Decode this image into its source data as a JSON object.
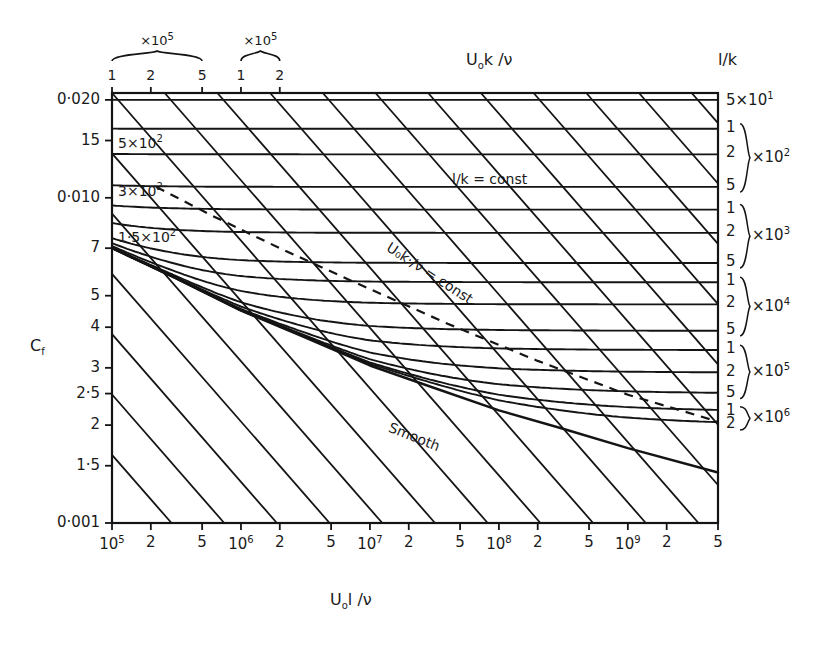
{
  "figure": {
    "kind": "engineering-chart",
    "background": "#ffffff",
    "ink_color": "#141414"
  },
  "axes": {
    "x": {
      "title_parts": {
        "main": "U",
        "sub": "o",
        "rest": "l /ν"
      },
      "title": "U₀ l /ν",
      "scale": "log",
      "range": [
        100000,
        5000000000
      ],
      "ticks": [
        {
          "value": 100000.0,
          "label": "10",
          "exp": "5"
        },
        {
          "value": 200000.0,
          "label": "2",
          "exp": ""
        },
        {
          "value": 500000.0,
          "label": "5",
          "exp": ""
        },
        {
          "value": 1000000.0,
          "label": "10",
          "exp": "6"
        },
        {
          "value": 2000000.0,
          "label": "2",
          "exp": ""
        },
        {
          "value": 5000000.0,
          "label": "5",
          "exp": ""
        },
        {
          "value": 10000000.0,
          "label": "10",
          "exp": "7"
        },
        {
          "value": 20000000.0,
          "label": "2",
          "exp": ""
        },
        {
          "value": 50000000.0,
          "label": "5",
          "exp": ""
        },
        {
          "value": 100000000.0,
          "label": "10",
          "exp": "8"
        },
        {
          "value": 200000000.0,
          "label": "2",
          "exp": ""
        },
        {
          "value": 500000000.0,
          "label": "5",
          "exp": ""
        },
        {
          "value": 1000000000.0,
          "label": "10",
          "exp": "9"
        },
        {
          "value": 2000000000.0,
          "label": "2",
          "exp": ""
        },
        {
          "value": 5000000000.0,
          "label": "5",
          "exp": ""
        }
      ]
    },
    "y": {
      "title_parts": {
        "main": "C",
        "sub": "f"
      },
      "title": "Cf",
      "scale": "log",
      "range": [
        0.001,
        0.021
      ],
      "ticks": [
        {
          "value": 0.02,
          "label": "0·020"
        },
        {
          "value": 0.015,
          "label": "15"
        },
        {
          "value": 0.01,
          "label": "0·010"
        },
        {
          "value": 0.007,
          "label": "7"
        },
        {
          "value": 0.005,
          "label": "5"
        },
        {
          "value": 0.004,
          "label": "4"
        },
        {
          "value": 0.003,
          "label": "3"
        },
        {
          "value": 0.0025,
          "label": "2·5"
        },
        {
          "value": 0.002,
          "label": "2"
        },
        {
          "value": 0.0015,
          "label": "1·5"
        },
        {
          "value": 0.001,
          "label": "0·001"
        }
      ]
    },
    "top": {
      "title_parts": {
        "main": "U",
        "sub": "o",
        "rest": "k /ν"
      },
      "title": "U₀k /ν",
      "groups": [
        {
          "multiplier": "×10",
          "exp": "3",
          "ticks": [
            "1",
            "2",
            "3",
            "5"
          ],
          "tick_values": [
            1000,
            2000,
            3000,
            5000
          ]
        },
        {
          "multiplier": "×10",
          "exp": "5",
          "ticks": [
            "1",
            "2",
            "5"
          ],
          "tick_values": [
            100000,
            200000,
            500000
          ]
        },
        {
          "multiplier": "×10",
          "exp": "5",
          "ticks": [
            "1",
            "2"
          ],
          "tick_values": [
            1000000,
            2000000
          ]
        }
      ]
    },
    "right": {
      "title": "l/k",
      "top_label": {
        "mantissa": "5",
        "multiplier": "×10",
        "exp": "1"
      },
      "groups": [
        {
          "ticks": [
            "1",
            "2",
            "5"
          ],
          "multiplier": "×10",
          "exp": "2",
          "values": [
            100,
            200,
            500
          ]
        },
        {
          "ticks": [
            "1",
            "2",
            "5"
          ],
          "multiplier": "×10",
          "exp": "3",
          "values": [
            1000,
            2000,
            5000
          ]
        },
        {
          "ticks": [
            "1",
            "2",
            "5"
          ],
          "multiplier": "×10",
          "exp": "4",
          "values": [
            10000,
            20000,
            50000
          ]
        },
        {
          "ticks": [
            "1",
            "2",
            "5"
          ],
          "multiplier": "×10",
          "exp": "5",
          "values": [
            100000,
            200000,
            500000
          ]
        },
        {
          "ticks": [
            "1",
            "2"
          ],
          "multiplier": "×10",
          "exp": "6",
          "values": [
            1000000,
            2000000
          ]
        }
      ]
    }
  },
  "annotations": {
    "lk_const": "l/k  = const",
    "uk_const": "U₀k·/ν = const",
    "smooth": "Smooth"
  },
  "curve_labels_left": [
    {
      "mantissa": "5×10",
      "exp": "2",
      "text": "5×10²"
    },
    {
      "mantissa": "3×10",
      "exp": "2",
      "text": "3×10²"
    },
    {
      "mantissa": "1·5×10",
      "exp": "2",
      "text": "1·5×10²"
    }
  ],
  "chart_data": {
    "type": "line",
    "xlabel": "U₀ l /ν",
    "ylabel": "Cf",
    "xscale": "log",
    "yscale": "log",
    "xlim": [
      100000,
      5000000000
    ],
    "ylim": [
      0.001,
      0.021
    ],
    "grid": false,
    "legend": "inline-annotations",
    "series_families": [
      {
        "name": "l/k = const (relative roughness curves)",
        "style": "solid",
        "note": "Each curve falls with Re then flattens to a constant C_f plateau at the right edge; plateau value set by l/k.",
        "curves": [
          {
            "lk": 50,
            "label": "5×10¹",
            "plateau_cf": 0.02
          },
          {
            "lk": 100,
            "label": "1×10²",
            "plateau_cf": 0.0163
          },
          {
            "lk": 200,
            "label": "2×10²",
            "plateau_cf": 0.0136
          },
          {
            "lk": 500,
            "label": "5×10²",
            "plateau_cf": 0.0108
          },
          {
            "lk": 1000,
            "label": "1×10³",
            "plateau_cf": 0.0092
          },
          {
            "lk": 2000,
            "label": "2×10³",
            "plateau_cf": 0.0078
          },
          {
            "lk": 5000,
            "label": "5×10³",
            "plateau_cf": 0.0063
          },
          {
            "lk": 10000,
            "label": "1×10⁴",
            "plateau_cf": 0.0055
          },
          {
            "lk": 20000,
            "label": "2×10⁴",
            "plateau_cf": 0.0047
          },
          {
            "lk": 50000,
            "label": "5×10⁴",
            "plateau_cf": 0.0039
          },
          {
            "lk": 100000,
            "label": "1×10⁵",
            "plateau_cf": 0.0034
          },
          {
            "lk": 200000,
            "label": "2×10⁵",
            "plateau_cf": 0.0029
          },
          {
            "lk": 500000,
            "label": "5×10⁵",
            "plateau_cf": 0.0025
          },
          {
            "lk": 1000000,
            "label": "1×10⁶",
            "plateau_cf": 0.0022
          },
          {
            "lk": 2000000,
            "label": "2×10⁶",
            "plateau_cf": 0.002
          }
        ]
      },
      {
        "name": "U₀k/ν = const (roughness Reynolds number lines)",
        "style": "solid-diagonal",
        "note": "Straight descending lines crossing the field from the top edge to the lower right.",
        "curves": [
          {
            "uk": 1000,
            "label": "1×10³"
          },
          {
            "uk": 2000,
            "label": "2×10³"
          },
          {
            "uk": 3000,
            "label": "3×10³"
          },
          {
            "uk": 5000,
            "label": "5×10³"
          },
          {
            "uk": 100000,
            "label": "1×10⁵"
          },
          {
            "uk": 200000,
            "label": "2×10⁵"
          },
          {
            "uk": 500000,
            "label": "5×10⁵"
          },
          {
            "uk": 1000000,
            "label": "1×10⁶"
          },
          {
            "uk": 2000000,
            "label": "2×10⁶"
          }
        ]
      },
      {
        "name": "Smooth plate",
        "style": "solid-bold",
        "label": "Smooth",
        "points": [
          {
            "x": 100000.0,
            "cf": 0.007
          },
          {
            "x": 300000.0,
            "cf": 0.0057
          },
          {
            "x": 1000000.0,
            "cf": 0.0045
          },
          {
            "x": 3000000.0,
            "cf": 0.00375
          },
          {
            "x": 10000000.0,
            "cf": 0.00305
          },
          {
            "x": 30000000.0,
            "cf": 0.00262
          },
          {
            "x": 100000000.0,
            "cf": 0.00222
          },
          {
            "x": 300000000.0,
            "cf": 0.00196
          },
          {
            "x": 1000000000.0,
            "cf": 0.0017
          },
          {
            "x": 5000000000.0,
            "cf": 0.00143
          }
        ]
      },
      {
        "name": "Transition boundary (fully rough limit)",
        "style": "dashed",
        "points": [
          {
            "x": 220000.0,
            "cf": 0.0108
          },
          {
            "x": 600000.0,
            "cf": 0.0088
          },
          {
            "x": 2000000.0,
            "cf": 0.007
          },
          {
            "x": 8000000.0,
            "cf": 0.00545
          },
          {
            "x": 40000000.0,
            "cf": 0.0041
          },
          {
            "x": 200000000.0,
            "cf": 0.00315
          },
          {
            "x": 1000000000.0,
            "cf": 0.00248
          },
          {
            "x": 5000000000.0,
            "cf": 0.00205
          }
        ]
      }
    ]
  }
}
